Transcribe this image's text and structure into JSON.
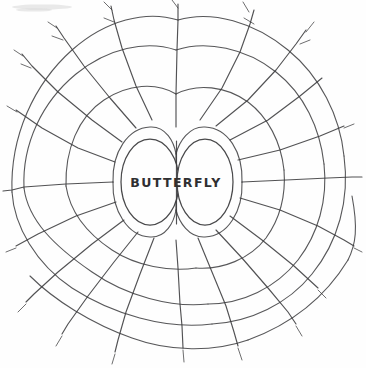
{
  "page": {
    "background_color": "#fefefe",
    "ink_color": "#3a3a3c",
    "width": 366,
    "height": 368,
    "medium": "hand-drawn pencil sketch on white paper"
  },
  "diagram": {
    "kind": "radial-web",
    "center_label": "BUTTERFLY",
    "center_label_left_part": "BUTTE",
    "center_label_right_part": "RFLY",
    "center": {
      "x": 176,
      "y": 180
    },
    "ring_count": 5,
    "spoke_count": 18,
    "cells_are_empty": true
  },
  "center_bubble": {
    "name": "butterfly-topic-bubble",
    "left_oval": {
      "cx": 150,
      "cy": 182,
      "rx": 29,
      "ry": 43
    },
    "right_oval": {
      "cx": 205,
      "cy": 182,
      "rx": 28,
      "ry": 43
    },
    "label": "BUTTERFLY"
  },
  "artifacts": {
    "top_left_smudge": "faint pencil smudge"
  }
}
